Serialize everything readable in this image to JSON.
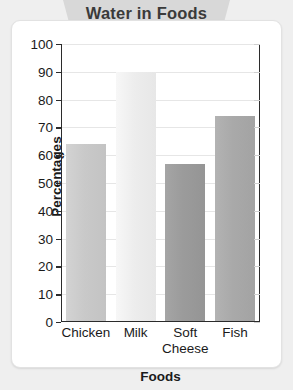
{
  "chart_data": {
    "type": "bar",
    "title": "Water in Foods",
    "xlabel": "Foods",
    "ylabel": "Percentages",
    "categories": [
      "Chicken",
      "Milk",
      "Soft\nCheese",
      "Fish"
    ],
    "values": [
      64,
      90,
      57,
      74
    ],
    "ylim": [
      0,
      100
    ],
    "yticks": [
      0,
      10,
      20,
      30,
      40,
      50,
      60,
      70,
      80,
      90,
      100
    ],
    "ytick_labels": [
      "0",
      "10",
      "20",
      "30",
      "40",
      "50",
      "60",
      "70",
      "80",
      "90",
      "100"
    ],
    "grid": true,
    "legend": "none",
    "bar_colors": [
      "#c9c9c9",
      "#ededed",
      "#9b9b9b",
      "#a9a9a9"
    ]
  },
  "colors": {
    "banner_bg": "#d8d8d8",
    "banner_text": "#3a3a3a",
    "page_bg": "#efefef",
    "card_bg": "#ffffff",
    "axis": "#2b2b2b",
    "gridline": "#e6e6e6",
    "text": "#1a1a1a"
  }
}
